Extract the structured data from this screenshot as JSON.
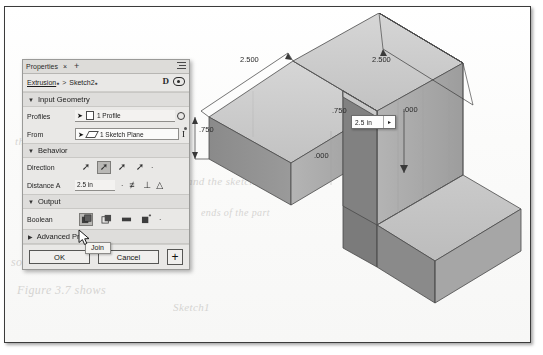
{
  "panel": {
    "tabs": {
      "title": "Properties",
      "close": "×",
      "add": "+",
      "menu_icon": "hamburger-icon"
    },
    "breadcrumb": {
      "parent": "Extrusion",
      "separator": ">",
      "child": "Sketch2"
    },
    "header_icons": [
      "display-mode-icon",
      "visibility-eye-icon"
    ],
    "sections": [
      {
        "id": "input-geometry",
        "label": "Input Geometry",
        "expanded_marker": "▼",
        "rows": [
          {
            "name": "Profiles",
            "value": "1 Profile",
            "icons": [
              "cursor-icon",
              "profile-sheet-icon"
            ],
            "trailing": "gear-icon"
          },
          {
            "name": "From",
            "value": "1 Sketch Plane",
            "icons": [
              "cursor-icon",
              "sketch-plane-icon"
            ],
            "trailing": "text-cursor-icon"
          }
        ]
      },
      {
        "id": "behavior",
        "label": "Behavior",
        "expanded_marker": "▼",
        "direction": {
          "name": "Direction",
          "options": [
            "one-side",
            "two-side",
            "symmetric",
            "asymmetric"
          ],
          "selected_index": 1,
          "more": "·"
        },
        "distance": {
          "name": "Distance A",
          "value": "2.5 in",
          "dropdown": "·",
          "icons": [
            "midplane-icon",
            "perpendicular-icon",
            "taper-icon"
          ]
        }
      },
      {
        "id": "output",
        "label": "Output",
        "expanded_marker": "▼",
        "boolean": {
          "name": "Boolean",
          "options": [
            "join",
            "cut",
            "intersect",
            "new-body"
          ],
          "selected_index": 0,
          "more": "·"
        }
      },
      {
        "id": "advanced",
        "label": "Advanced Pro",
        "expanded_marker": "▶"
      }
    ],
    "buttons": {
      "ok": "OK",
      "cancel": "Cancel",
      "plus": "+"
    },
    "tooltip": "Join"
  },
  "model": {
    "dimensions": [
      {
        "id": "top-left-width",
        "text": "2.500"
      },
      {
        "id": "top-right-width",
        "text": "2.500"
      },
      {
        "id": "left-height",
        "text": ".750"
      },
      {
        "id": "inner-depth",
        "text": ".750"
      },
      {
        "id": "right-offset",
        "text": ".000"
      },
      {
        "id": "bottom-origin",
        "text": ".000"
      }
    ],
    "inline_edit": {
      "value": "2.5 in",
      "arrow": "▸"
    }
  },
  "background_text": [
    "the material is added to",
    "and the sketch is",
    "solid model  with a",
    "Figure 3.7  shows",
    "Sketch1",
    "ends of the part"
  ],
  "colors": {
    "panel_bg": "#e9e8e6",
    "section_bg": "#dedddb",
    "selected": "#b9b8b5",
    "face_top": "#cfcfcf",
    "face_left": "#8e8e8e",
    "face_right": "#a8a8a8",
    "outline": "#4a4a4a"
  }
}
